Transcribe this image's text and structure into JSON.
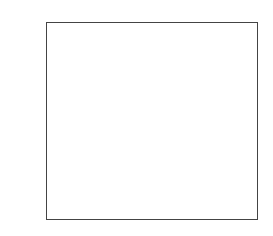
{
  "chart_data": {
    "type": "bar",
    "title": "",
    "xlabel": "",
    "ylabel": "",
    "categories": [
      "1996",
      "1997",
      "1998",
      "1999",
      "2000",
      "2001"
    ],
    "values": [
      200,
      400,
      100,
      -100,
      400,
      300
    ],
    "ylim": [
      -200,
      400
    ],
    "yticks": [
      "400",
      "300",
      "200",
      "100",
      "0",
      "−100",
      "−200"
    ],
    "grid": true,
    "bar_color": "#8a8a8a",
    "legend": null
  }
}
